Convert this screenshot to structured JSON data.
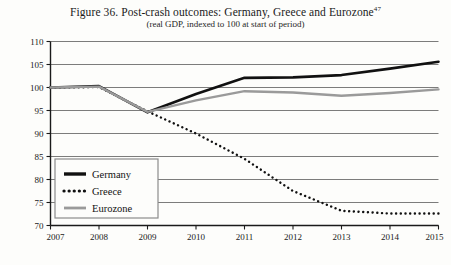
{
  "figure": {
    "title_prefix": "Figure 36. Post-crash outcomes: Germany, Greece and Eurozone",
    "title_footnote": "47",
    "subtitle": "(real GDP, indexed to 100 at start of period)"
  },
  "chart_data": {
    "type": "line",
    "title": "Figure 36. Post-crash outcomes: Germany, Greece and Eurozone47",
    "subtitle": "(real GDP, indexed to 100 at start of period)",
    "xlabel": "",
    "ylabel": "",
    "x": [
      2007,
      2008,
      2009,
      2010,
      2011,
      2012,
      2013,
      2014,
      2015
    ],
    "categories": [
      "2007",
      "2008",
      "2009",
      "2010",
      "2011",
      "2012",
      "2013",
      "2014",
      "2015"
    ],
    "xlim": [
      2007,
      2015
    ],
    "ylim": [
      70,
      110
    ],
    "yticks": [
      70,
      75,
      80,
      85,
      90,
      95,
      100,
      105,
      110
    ],
    "ytick_labels": [
      "70",
      "75",
      "80",
      "85",
      "90",
      "95",
      "100",
      "105",
      "110"
    ],
    "grid": true,
    "grid_axis": "y",
    "legend_position": "lower-left",
    "series": [
      {
        "name": "Germany",
        "values": [
          100,
          100.3,
          94.6,
          98.6,
          102.1,
          102.2,
          102.7,
          104.1,
          105.6
        ],
        "color": "#111111",
        "style": "solid",
        "width": 2.6
      },
      {
        "name": "Greece",
        "values": [
          100,
          100.1,
          94.8,
          90.0,
          84.5,
          77.5,
          73.2,
          72.6,
          72.6
        ],
        "color": "#111111",
        "style": "dotted",
        "width": 2.4
      },
      {
        "name": "Eurozone",
        "values": [
          100,
          100.2,
          94.7,
          97.2,
          99.2,
          98.9,
          98.2,
          98.8,
          99.6
        ],
        "color": "#9a9a9a",
        "style": "solid",
        "width": 2.4
      }
    ]
  },
  "axes": {
    "y_tick_labels": [
      "110",
      "105",
      "100",
      "95",
      "90",
      "85",
      "80",
      "75",
      "70"
    ],
    "x_tick_labels": [
      "2007",
      "2008",
      "2009",
      "2010",
      "2011",
      "2012",
      "2013",
      "2014",
      "2015"
    ]
  },
  "legend": {
    "items": [
      {
        "label": "Germany",
        "swatch": "solid-black-thick"
      },
      {
        "label": "Greece",
        "swatch": "dotted-black"
      },
      {
        "label": "Eurozone",
        "swatch": "solid-gray"
      }
    ]
  },
  "colors": {
    "germany": "#111111",
    "greece": "#111111",
    "eurozone": "#9a9a9a",
    "grid": "#5a5a5a",
    "axis": "#1a1a1a",
    "background": "#fdfdfb"
  }
}
